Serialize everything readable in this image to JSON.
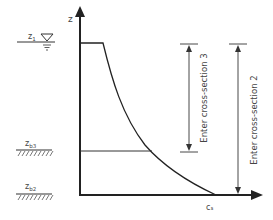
{
  "diagram": {
    "axes": {
      "y_label": "z",
      "x_label": "cₛ"
    },
    "levels": [
      {
        "id": "z1",
        "label": "z",
        "subscript": "1",
        "type": "water-surface"
      },
      {
        "id": "zb3",
        "label": "z",
        "subscript": "b3",
        "type": "bed"
      },
      {
        "id": "zb2",
        "label": "z",
        "subscript": "b2",
        "type": "bed"
      }
    ],
    "dimensions": [
      {
        "id": "cs3",
        "label": "Enter cross-section 3"
      },
      {
        "id": "cs2",
        "label": "Enter cross-section 2"
      }
    ],
    "colors": {
      "line": "#222222",
      "text": "#444444",
      "hatch": "#555555"
    }
  }
}
